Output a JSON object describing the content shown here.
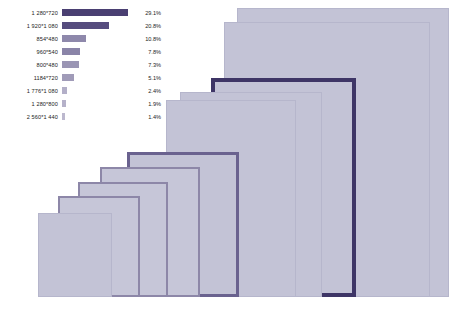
{
  "chart_data": {
    "type": "bar",
    "title": "",
    "xlabel": "",
    "ylabel": "",
    "orientation": "horizontal",
    "grid": false,
    "legend_position": "top-left",
    "xlim": [
      0,
      29.1
    ],
    "categories": [
      "1 280*720",
      "1 920*1 080",
      "854*480",
      "960*540",
      "800*480",
      "1184*720",
      "1 776*1 080",
      "1 280*800",
      "2 560*1 440"
    ],
    "values": [
      29.1,
      20.8,
      10.8,
      7.8,
      7.3,
      5.1,
      2.4,
      1.9,
      1.4
    ],
    "value_labels": [
      "29.1%",
      "20.8%",
      "10.8%",
      "7.8%",
      "7.3%",
      "5.1%",
      "2.4%",
      "1.9%",
      "1.4%"
    ],
    "bar_colors": [
      "#4a3f72",
      "#564c7e",
      "#8e88ab",
      "#8a84a8",
      "#9a95b4",
      "#a09bb8",
      "#b3afc8",
      "#b5b1c9",
      "#bcb8ce"
    ]
  },
  "diagram": {
    "fill_color": "#c3c3d6",
    "accent_color": "#3e3566",
    "secondary_accent_color": "#6a628f",
    "rectangles": [
      {
        "name": "2 560*1 440",
        "left": 237,
        "top": 8,
        "width": 212,
        "height": 289,
        "style": "plain"
      },
      {
        "name": "1 920*1 080",
        "left": 224,
        "top": 22,
        "width": 206,
        "height": 275,
        "style": "plain"
      },
      {
        "name": "1 776*1 080",
        "left": 211,
        "top": 78,
        "width": 145,
        "height": 219,
        "style": "accent"
      },
      {
        "name": "1 280*800",
        "left": 180,
        "top": 92,
        "width": 142,
        "height": 205,
        "style": "plain"
      },
      {
        "name": "1 280*720",
        "left": 166,
        "top": 100,
        "width": 130,
        "height": 197,
        "style": "plain"
      },
      {
        "name": "1184*720",
        "left": 127,
        "top": 152,
        "width": 112,
        "height": 145,
        "style": "accent2"
      },
      {
        "name": "960*540",
        "left": 100,
        "top": 167,
        "width": 100,
        "height": 130,
        "style": "soft"
      },
      {
        "name": "854*480",
        "left": 78,
        "top": 182,
        "width": 90,
        "height": 115,
        "style": "soft"
      },
      {
        "name": "800*480",
        "left": 58,
        "top": 196,
        "width": 82,
        "height": 101,
        "style": "soft"
      },
      {
        "name": "640*360",
        "left": 38,
        "top": 213,
        "width": 74,
        "height": 84,
        "style": "plain"
      }
    ]
  }
}
